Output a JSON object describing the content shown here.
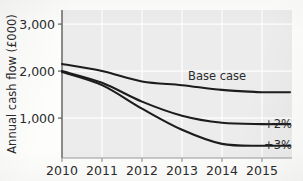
{
  "figure": {
    "background_color": "#fdfdfc",
    "plot_background_color": "#ececec",
    "gridline_color": "#ffffff",
    "axis_color": "#5d5d5d",
    "line_color": "#1c1c1c"
  },
  "chart_data": {
    "type": "line",
    "title": "",
    "xlabel": "",
    "ylabel": "Annual cash flow (£000)",
    "x": [
      2010,
      2011,
      2012,
      2013,
      2014,
      2015
    ],
    "categories": [
      "2010",
      "2011",
      "2012",
      "2013",
      "2014",
      "2015"
    ],
    "xtick_labels": [
      "2010",
      "2011",
      "2012",
      "2013",
      "2014",
      "2015"
    ],
    "ytick_labels": [
      "1,000",
      "2,000",
      "3,000"
    ],
    "yticks": [
      1000,
      2000,
      3000
    ],
    "xlim": [
      2010,
      2015.75
    ],
    "ylim": [
      150,
      3300
    ],
    "grid": true,
    "legend_position": "inline-right-annotations",
    "series": [
      {
        "name": "Base case",
        "label": "Base case",
        "values": [
          2150,
          2000,
          1780,
          1700,
          1600,
          1550
        ]
      },
      {
        "name": "+2%",
        "label": "+2%",
        "values": [
          2000,
          1750,
          1350,
          1050,
          900,
          870
        ]
      },
      {
        "name": "+3%",
        "label": "+3%",
        "values": [
          1980,
          1700,
          1200,
          750,
          450,
          410
        ]
      }
    ],
    "annotations": [
      {
        "text": "Base case",
        "x": 2013.15,
        "y": 1900
      },
      {
        "text": "+2%",
        "x": 2015.05,
        "y": 880
      },
      {
        "text": "+3%",
        "x": 2015.05,
        "y": 420
      }
    ]
  }
}
